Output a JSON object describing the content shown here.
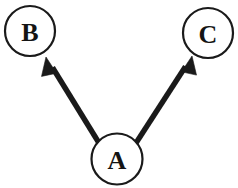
{
  "diagram": {
    "type": "directed-graph",
    "canvas": {
      "width": 238,
      "height": 188
    },
    "background_color": "#ffffff",
    "stroke_color": "#1a1a1a",
    "label_color": "#141414",
    "nodes": [
      {
        "id": "B",
        "label": "B",
        "cx": 30,
        "cy": 31,
        "r": 25
      },
      {
        "id": "C",
        "label": "C",
        "cx": 208,
        "cy": 33,
        "r": 25
      },
      {
        "id": "A",
        "label": "A",
        "cx": 117,
        "cy": 159,
        "r": 25.5
      }
    ],
    "edges": [
      {
        "id": "A-to-B",
        "from": "A",
        "to": "B",
        "label": "",
        "directed": true,
        "tail_x": 99,
        "tail_y": 143,
        "head_x": 46,
        "head_y": 57
      },
      {
        "id": "A-to-C",
        "from": "A",
        "to": "C",
        "label": "",
        "directed": true,
        "tail_x": 136,
        "tail_y": 143,
        "head_x": 192,
        "head_y": 56
      }
    ]
  }
}
